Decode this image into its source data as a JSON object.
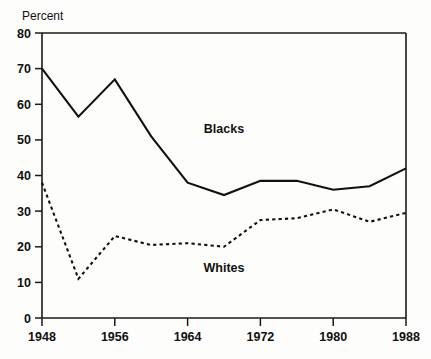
{
  "chart_data": {
    "type": "line",
    "title": "",
    "ylabel": "Percent",
    "xlabel": "",
    "ylim": [
      0,
      80
    ],
    "xlim": [
      1948,
      1988
    ],
    "yticks": [
      "0",
      "10",
      "20",
      "30",
      "40",
      "50",
      "60",
      "70",
      "80"
    ],
    "ytick_values": [
      0,
      10,
      20,
      30,
      40,
      50,
      60,
      70,
      80
    ],
    "xticks": [
      "1948",
      "1956",
      "1964",
      "1972",
      "1980",
      "1988"
    ],
    "xtick_values": [
      1948,
      1956,
      1964,
      1972,
      1980,
      1988
    ],
    "grid": false,
    "legend_position": "inline-annotations",
    "x": [
      1948,
      1952,
      1956,
      1960,
      1964,
      1968,
      1972,
      1976,
      1980,
      1984,
      1988
    ],
    "series": [
      {
        "name": "Blacks",
        "style": "solid",
        "color": "#111111",
        "label_x": 1968,
        "label_y": 52,
        "values": [
          70,
          56.5,
          67,
          51,
          38,
          34.5,
          38.5,
          38.5,
          36,
          37,
          42
        ]
      },
      {
        "name": "Whites",
        "style": "dashed",
        "color": "#111111",
        "label_x": 1968,
        "label_y": 13,
        "values": [
          38,
          11,
          23,
          20.5,
          21,
          20,
          27.5,
          28,
          30.5,
          27,
          29.5
        ]
      }
    ]
  },
  "labels": {
    "y_axis_title": "Percent",
    "blacks_annotation": "Blacks",
    "whites_annotation": "Whites"
  }
}
